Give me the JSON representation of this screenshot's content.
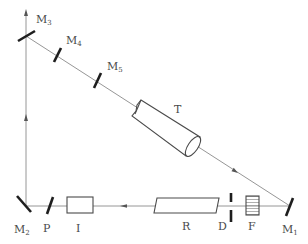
{
  "diagram": {
    "type": "optical-setup",
    "labels": {
      "M1": {
        "main": "M",
        "sub": "1"
      },
      "M2": {
        "main": "M",
        "sub": "2"
      },
      "M3": {
        "main": "M",
        "sub": "3"
      },
      "M4": {
        "main": "M",
        "sub": "4"
      },
      "M5": {
        "main": "M",
        "sub": "5"
      },
      "T": "T",
      "P": "P",
      "I": "I",
      "R": "R",
      "D": "D",
      "F": "F"
    },
    "components": [
      {
        "id": "M1",
        "kind": "mirror"
      },
      {
        "id": "M2",
        "kind": "mirror"
      },
      {
        "id": "M3",
        "kind": "mirror"
      },
      {
        "id": "M4",
        "kind": "mirror"
      },
      {
        "id": "M5",
        "kind": "mirror"
      },
      {
        "id": "T",
        "kind": "telescope"
      },
      {
        "id": "P",
        "kind": "plate"
      },
      {
        "id": "I",
        "kind": "box"
      },
      {
        "id": "R",
        "kind": "rod"
      },
      {
        "id": "D",
        "kind": "diaphragm"
      },
      {
        "id": "F",
        "kind": "filter"
      }
    ],
    "beam_path": [
      "M2",
      "P",
      "I",
      "R",
      "D",
      "F",
      "M1",
      "T",
      "M5",
      "M4",
      "M3"
    ],
    "colors": {
      "beam": "#8a8a8a",
      "mirror": "#1e1e1e",
      "outline": "#4a4a4a"
    }
  }
}
